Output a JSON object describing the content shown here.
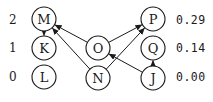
{
  "diagram": {
    "type": "directed-graph",
    "left_labels": [
      {
        "text": "2",
        "y": 20
      },
      {
        "text": "1",
        "y": 48
      },
      {
        "text": "0",
        "y": 77
      }
    ],
    "right_labels": [
      {
        "text": "0.29",
        "y": 20
      },
      {
        "text": "0.14",
        "y": 48
      },
      {
        "text": "0.00",
        "y": 77
      }
    ],
    "nodes": [
      {
        "id": "M",
        "label": "M",
        "x": 44,
        "y": 19
      },
      {
        "id": "K",
        "label": "K",
        "x": 44,
        "y": 48
      },
      {
        "id": "L",
        "label": "L",
        "x": 44,
        "y": 77
      },
      {
        "id": "O",
        "label": "O",
        "x": 98,
        "y": 48
      },
      {
        "id": "N",
        "label": "N",
        "x": 98,
        "y": 78
      },
      {
        "id": "P",
        "label": "P",
        "x": 153,
        "y": 19
      },
      {
        "id": "Q",
        "label": "Q",
        "x": 153,
        "y": 48
      },
      {
        "id": "J",
        "label": "J",
        "x": 153,
        "y": 78
      }
    ],
    "edges": [
      {
        "from": "M",
        "to": "K"
      },
      {
        "from": "O",
        "to": "M"
      },
      {
        "from": "N",
        "to": "M"
      },
      {
        "from": "O",
        "to": "P"
      },
      {
        "from": "N",
        "to": "P"
      },
      {
        "from": "J",
        "to": "O"
      },
      {
        "from": "J",
        "to": "Q"
      }
    ],
    "colors": {
      "stroke": "#1a1a1a",
      "background": "#ffffff"
    }
  }
}
